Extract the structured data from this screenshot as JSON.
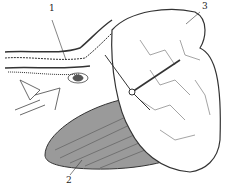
{
  "figure": {
    "type": "anatomical line illustration",
    "labels": [
      {
        "id": "1",
        "text": "1",
        "x": 49,
        "y": 12
      },
      {
        "id": "2",
        "text": "2",
        "x": 66,
        "y": 180
      },
      {
        "id": "3",
        "text": "3",
        "x": 202,
        "y": 8
      }
    ],
    "colors": {
      "ink": "#2a2a2a",
      "paper": "#ffffff",
      "shade": "#8a8a8a"
    }
  }
}
